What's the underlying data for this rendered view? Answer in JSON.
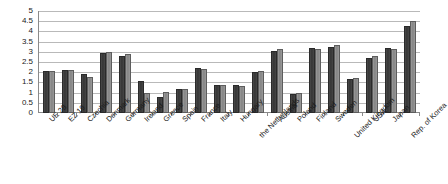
{
  "chart_data": {
    "type": "bar",
    "title": "",
    "xlabel": "",
    "ylabel": "",
    "ylim": [
      0,
      5
    ],
    "yticks": [
      "0",
      "0.5",
      "1",
      "1.5",
      "2",
      "2.5",
      "3",
      "3.5",
      "4",
      "4.5",
      "5"
    ],
    "grid": true,
    "legend": "none",
    "categories": [
      "UE 28",
      "EZ 19",
      "Czechia",
      "Denmark",
      "Germany",
      "Ireland",
      "Greece",
      "Spain",
      "France",
      "Italy",
      "Hungary",
      "the Netherlands",
      "Austria",
      "Poland",
      "Finland",
      "Sweden",
      "United Kingdom",
      "USA",
      "Japan",
      "Rep. of Korea"
    ],
    "series": [
      {
        "name": "series-1",
        "color": "#3f3f3f",
        "values": [
          2.05,
          2.1,
          1.9,
          2.95,
          2.8,
          1.55,
          0.8,
          1.2,
          2.2,
          1.35,
          1.35,
          2.0,
          3.05,
          0.95,
          3.2,
          3.25,
          1.65,
          2.7,
          3.2,
          4.25
        ]
      },
      {
        "name": "series-2",
        "color": "#8e8e8e",
        "values": [
          2.05,
          2.1,
          1.75,
          3.0,
          2.9,
          1.0,
          1.05,
          1.2,
          2.15,
          1.35,
          1.3,
          2.05,
          3.15,
          1.0,
          3.15,
          3.35,
          1.7,
          2.8,
          3.15,
          4.5
        ]
      }
    ],
    "label_rows": [
      0,
      0,
      0,
      0,
      0,
      0,
      0,
      0,
      0,
      0,
      0,
      1,
      0,
      0,
      0,
      0,
      1,
      0,
      0,
      1
    ]
  }
}
